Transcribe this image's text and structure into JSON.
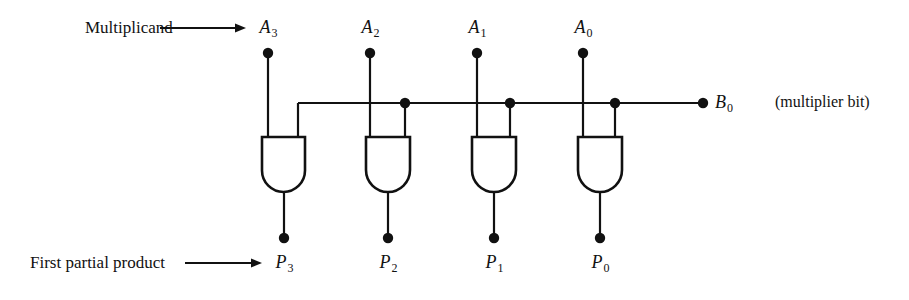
{
  "figure": {
    "background_color": "#ffffff",
    "line_color": "#111111",
    "width": 909,
    "height": 300
  },
  "annotations": {
    "multiplicand_label": "Multiplicand",
    "partial_product_label": "First partial product",
    "multiplier_note": "(multiplier bit)"
  },
  "inputs": [
    {
      "id": "A3",
      "label": "A",
      "subscript": "3",
      "x": 268,
      "dot_y": 53,
      "label_x": 268,
      "label_y": 28
    },
    {
      "id": "A2",
      "label": "A",
      "subscript": "2",
      "x": 370,
      "dot_y": 53,
      "label_x": 370,
      "label_y": 28
    },
    {
      "id": "A1",
      "label": "A",
      "subscript": "1",
      "x": 477,
      "dot_y": 53,
      "label_x": 477,
      "label_y": 28
    },
    {
      "id": "A0",
      "label": "A",
      "subscript": "0",
      "x": 583,
      "dot_y": 53,
      "label_x": 583,
      "label_y": 28
    }
  ],
  "multiplier": {
    "id": "B0",
    "label": "B",
    "subscript": "0",
    "terminal_x": 703,
    "bus_y": 103,
    "bus_start_x": 298,
    "label_x": 715,
    "label_y": 103,
    "note_x": 775,
    "note_y": 103
  },
  "gates": [
    {
      "id": "AND3",
      "type": "AND",
      "left": 262,
      "right": 305,
      "top": 137,
      "bottom": 192,
      "out_x": 284,
      "out_dot_y": 238,
      "in_left_x": 268,
      "in_right_x": 298
    },
    {
      "id": "AND2",
      "type": "AND",
      "left": 366,
      "right": 410,
      "top": 137,
      "bottom": 192,
      "out_x": 388,
      "out_dot_y": 238,
      "in_left_x": 370,
      "in_right_x": 405
    },
    {
      "id": "AND1",
      "type": "AND",
      "left": 472,
      "right": 516,
      "top": 137,
      "bottom": 192,
      "out_x": 494,
      "out_dot_y": 238,
      "in_left_x": 477,
      "in_right_x": 510
    },
    {
      "id": "AND0",
      "type": "AND",
      "left": 578,
      "right": 622,
      "top": 137,
      "bottom": 192,
      "out_x": 600,
      "out_dot_y": 238,
      "in_left_x": 583,
      "in_right_x": 615
    }
  ],
  "outputs": [
    {
      "id": "P3",
      "label": "P",
      "subscript": "3",
      "x": 284,
      "dot_y": 238,
      "label_x": 284,
      "label_y": 263
    },
    {
      "id": "P2",
      "label": "P",
      "subscript": "2",
      "x": 388,
      "dot_y": 238,
      "label_x": 388,
      "label_y": 263
    },
    {
      "id": "P1",
      "label": "P",
      "subscript": "1",
      "x": 494,
      "dot_y": 238,
      "label_x": 494,
      "label_y": 263
    },
    {
      "id": "P0",
      "label": "P",
      "subscript": "0",
      "x": 600,
      "dot_y": 238,
      "label_x": 600,
      "label_y": 263
    }
  ],
  "junction_dots": [
    {
      "id": "bus-tap-A2",
      "x": 405,
      "y": 103
    },
    {
      "id": "bus-tap-A1",
      "x": 510,
      "y": 103
    },
    {
      "id": "bus-tap-A0",
      "x": 615,
      "y": 103
    }
  ],
  "arrows": [
    {
      "id": "multiplicand-arrow",
      "x1": 160,
      "y1": 28,
      "x2": 246,
      "y2": 28
    },
    {
      "id": "partial-product-arrow",
      "x1": 185,
      "y1": 263,
      "x2": 262,
      "y2": 263
    }
  ],
  "text_positions": {
    "multiplicand_x": 85,
    "multiplicand_y": 28,
    "partial_product_x": 30,
    "partial_product_y": 263
  }
}
